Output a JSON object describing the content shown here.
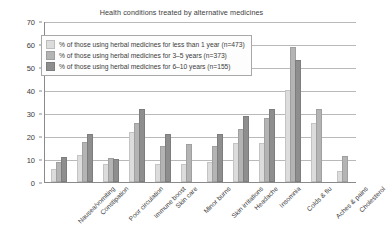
{
  "chart_data": {
    "type": "bar",
    "title": "Health conditions treated by alternative medicines",
    "xlabel": "",
    "ylabel": "",
    "ylim": [
      0,
      70
    ],
    "ytick_step": 10,
    "yticks": [
      0,
      10,
      20,
      30,
      40,
      50,
      60,
      70
    ],
    "grid": true,
    "legend_position": "upper-left",
    "categories": [
      "Nausea/vomiting",
      "Constipation",
      "Poor circulation",
      "Immune boost",
      "Skin care",
      "Minor burns",
      "Skin irritations",
      "Headache",
      "Insomnia",
      "Colds & flu",
      "Aches & pains",
      "Cholesterol"
    ],
    "series": [
      {
        "name": "% of those using herbal medicines for less than 1 year (n=473)",
        "color": "#dcdcdc",
        "values": [
          5,
          11,
          7,
          21,
          7,
          7,
          8,
          16,
          16,
          39,
          25,
          4
        ]
      },
      {
        "name": "% of those using herbal medicines for 3–5 years (n=373)",
        "color": "#b4b4b4",
        "values": [
          8,
          16.5,
          9.5,
          25,
          15,
          15.5,
          15,
          22,
          27,
          58,
          31,
          10.5
        ]
      },
      {
        "name": "% of those using herbal medicines for 6–10 years  (n=155)",
        "color": "#8e8e8e",
        "values": [
          10,
          20,
          9,
          31,
          20,
          0,
          20,
          28,
          31,
          52,
          0,
          0
        ]
      }
    ]
  },
  "legend": {
    "items": [
      {
        "label": "% of those using herbal medicines for less than 1 year (n=473)",
        "swatch": "s0"
      },
      {
        "label": "% of those using herbal medicines for 3–5 years (n=373)",
        "swatch": "s1"
      },
      {
        "label": "% of those using herbal medicines for 6–10 years  (n=155)",
        "swatch": "s2"
      }
    ]
  }
}
